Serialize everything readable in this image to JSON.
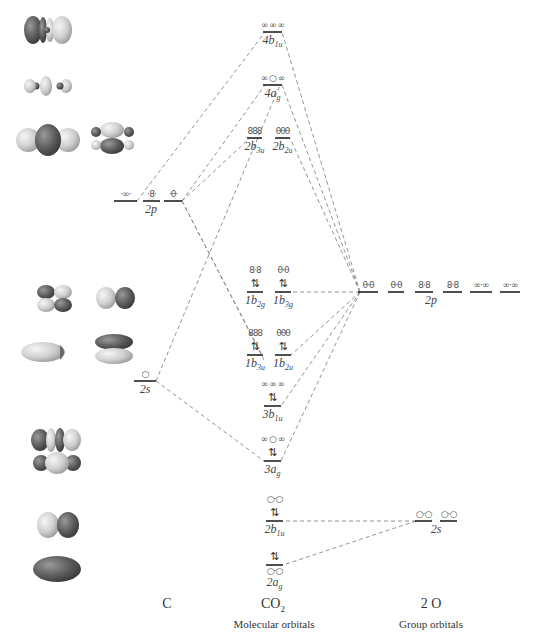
{
  "columns": {
    "carbon": {
      "title": "C"
    },
    "molecule": {
      "title": "CO2",
      "title_main": "CO",
      "title_sub": "2",
      "subtitle": "Molecular orbitals"
    },
    "oxygen": {
      "title": "2 O",
      "subtitle": "Group orbitals"
    }
  },
  "carbon_levels": [
    {
      "id": "C-2p",
      "label": "2p",
      "y": 201,
      "segments": [
        [
          114,
          137
        ],
        [
          143,
          160
        ],
        [
          164,
          182
        ]
      ],
      "glyphs": [
        "·∞·",
        "·8·",
        "·θ·"
      ]
    },
    {
      "id": "C-2s",
      "label": "2s",
      "y": 381,
      "segments": [
        [
          134,
          156
        ]
      ],
      "glyphs": [
        "○"
      ]
    }
  ],
  "mo_levels": [
    {
      "id": "4b1u",
      "main": "4b",
      "sub": "1u",
      "x1": 263,
      "x2": 282,
      "y": 32,
      "glyph": "∞ ∞ ∞",
      "electrons": ""
    },
    {
      "id": "4ag",
      "main": "4a",
      "sub": "g",
      "x1": 263,
      "x2": 282,
      "y": 85,
      "glyph": "∞ ○ ∞",
      "electrons": ""
    },
    {
      "id": "2b3u",
      "main": "2b",
      "sub": "3u",
      "x1": 247,
      "x2": 262,
      "y": 138,
      "glyph": "888",
      "electrons": ""
    },
    {
      "id": "2b2u",
      "main": "2b",
      "sub": "2u",
      "x1": 275,
      "x2": 290,
      "y": 138,
      "glyph": "θθθ",
      "electrons": ""
    },
    {
      "id": "1b2g",
      "main": "1b",
      "sub": "2g",
      "x1": 247,
      "x2": 263,
      "y": 292,
      "glyph": "8·8",
      "electrons": "⇅"
    },
    {
      "id": "1b3g",
      "main": "1b",
      "sub": "3g",
      "x1": 275,
      "x2": 291,
      "y": 292,
      "glyph": "θ·θ",
      "electrons": "⇅"
    },
    {
      "id": "1b3u",
      "main": "1b",
      "sub": "3u",
      "x1": 247,
      "x2": 263,
      "y": 355,
      "glyph": "888",
      "electrons": "⇅"
    },
    {
      "id": "1b2u",
      "main": "1b",
      "sub": "2u",
      "x1": 275,
      "x2": 291,
      "y": 355,
      "glyph": "θθθ",
      "electrons": "⇅"
    },
    {
      "id": "3b1u",
      "main": "3b",
      "sub": "1u",
      "x1": 264,
      "x2": 281,
      "y": 406,
      "glyph": "∞ ∞ ∞",
      "electrons": "⇅"
    },
    {
      "id": "3ag",
      "main": "3a",
      "sub": "g",
      "x1": 264,
      "x2": 281,
      "y": 461,
      "glyph": "∞ ○ ∞",
      "electrons": "⇅"
    },
    {
      "id": "2b1u",
      "main": "2b",
      "sub": "1u",
      "x1": 266,
      "x2": 283,
      "y": 521,
      "glyph": "○·○",
      "electrons": "⇅"
    },
    {
      "id": "2ag",
      "main": "2a",
      "sub": "g",
      "x1": 266,
      "x2": 283,
      "y": 565,
      "glyph": "○·○",
      "electrons": "⇅"
    }
  ],
  "oxygen_levels": [
    {
      "id": "O-2p",
      "label": "2p",
      "y": 292,
      "segments": [
        [
          358,
          378
        ],
        [
          388,
          404
        ],
        [
          415,
          433
        ],
        [
          443,
          462
        ],
        [
          470,
          492
        ],
        [
          500,
          520
        ]
      ],
      "glyphs": [
        "θ·θ",
        "θ·θ",
        "8·8",
        "8·8",
        "∞·∞",
        "∞·∞"
      ]
    },
    {
      "id": "O-2s",
      "label": "2s",
      "y": 521,
      "segments": [
        [
          415,
          432
        ],
        [
          440,
          457
        ]
      ],
      "glyphs": [
        "○·○",
        "○·○"
      ]
    }
  ],
  "correlation_lines": [
    [
      137,
      201,
      265,
      32
    ],
    [
      182,
      201,
      265,
      85
    ],
    [
      182,
      201,
      250,
      138
    ],
    [
      182,
      201,
      262,
      355
    ],
    [
      182,
      201,
      264,
      360
    ],
    [
      156,
      381,
      280,
      85
    ],
    [
      156,
      381,
      264,
      461
    ],
    [
      360,
      292,
      282,
      32
    ],
    [
      360,
      292,
      282,
      85
    ],
    [
      360,
      292,
      290,
      138
    ],
    [
      360,
      292,
      291,
      292
    ],
    [
      360,
      292,
      291,
      355
    ],
    [
      360,
      292,
      281,
      406
    ],
    [
      360,
      292,
      281,
      461
    ],
    [
      416,
      521,
      283,
      521
    ],
    [
      416,
      521,
      283,
      565
    ]
  ],
  "orbital_images": [
    {
      "name": "4b1u-surface",
      "cx": 46,
      "cy": 30
    },
    {
      "name": "4ag-surface",
      "cx": 46,
      "cy": 86
    },
    {
      "name": "2b3u-surface",
      "cx": 46,
      "cy": 138
    },
    {
      "name": "2b2u-surface",
      "cx": 112,
      "cy": 138
    },
    {
      "name": "1b2g-surface",
      "cx": 54,
      "cy": 298
    },
    {
      "name": "1b3g-surface",
      "cx": 115,
      "cy": 298
    },
    {
      "name": "1b3u-surface",
      "cx": 43,
      "cy": 352
    },
    {
      "name": "1b2u-surface",
      "cx": 114,
      "cy": 350
    },
    {
      "name": "3b1u-surface",
      "cx": 60,
      "cy": 440
    },
    {
      "name": "3ag-surface",
      "cx": 57,
      "cy": 463
    },
    {
      "name": "2b1u-surface",
      "cx": 57,
      "cy": 525
    },
    {
      "name": "2ag-surface",
      "cx": 57,
      "cy": 569
    }
  ],
  "colors": {
    "dark_lobe": "#5a5a5a",
    "light_lobe": "#d0d0d0",
    "level": "#222222",
    "dash": "#888888"
  }
}
